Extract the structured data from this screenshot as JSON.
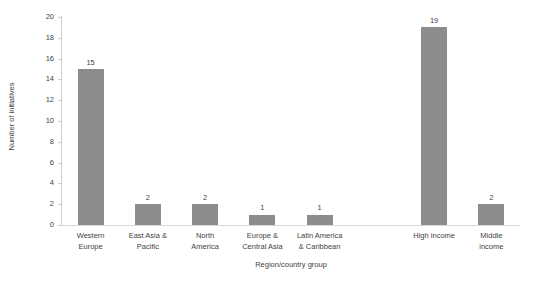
{
  "chart_data": {
    "type": "bar",
    "title": "",
    "subtitle": "",
    "xlabel": "Region/country group",
    "ylabel": "Number of initiatives",
    "ylim": [
      0,
      20
    ],
    "ytick_step": 2,
    "yticks": [
      20,
      18,
      16,
      14,
      12,
      10,
      8,
      6,
      4,
      2,
      0
    ],
    "grid": false,
    "legend": null,
    "legend_position": "none",
    "bar_color": "#8c8c8c",
    "axis_color": "#d0d0d0",
    "text_color": "#3f3f3f",
    "background_color": "#ffffff",
    "data_labels_shown": true,
    "categories": [
      "Western Europe",
      "East Asia & Pacific",
      "North America",
      "Europe & Central Asia",
      "Latin America & Caribbean",
      "",
      "High income",
      "Middle income"
    ],
    "values": [
      15,
      2,
      2,
      1,
      1,
      null,
      19,
      2
    ],
    "bars": [
      {
        "label_line1": "Western",
        "label_line2": "Europe",
        "value": 15,
        "value_label": "15"
      },
      {
        "label_line1": "East Asia &",
        "label_line2": "Pacific",
        "value": 2,
        "value_label": "2"
      },
      {
        "label_line1": "North",
        "label_line2": "America",
        "value": 2,
        "value_label": "2"
      },
      {
        "label_line1": "Europe &",
        "label_line2": "Central Asia",
        "value": 1,
        "value_label": "1"
      },
      {
        "label_line1": "Latin America",
        "label_line2": "& Caribbean",
        "value": 1,
        "value_label": "1"
      },
      {
        "label_line1": "",
        "label_line2": "",
        "value": null,
        "value_label": ""
      },
      {
        "label_line1": "High income",
        "label_line2": "",
        "value": 19,
        "value_label": "19"
      },
      {
        "label_line1": "Middle",
        "label_line2": "income",
        "value": 2,
        "value_label": "2"
      }
    ]
  }
}
